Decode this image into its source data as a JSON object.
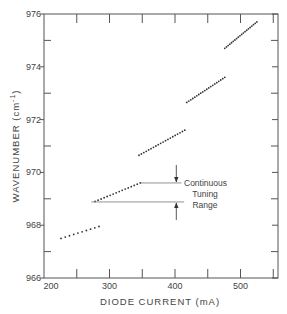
{
  "chart_data": {
    "type": "scatter",
    "title": "",
    "xlabel": "DIODE CURRENT (mA)",
    "ylabel": "WAVENUMBER (cm⁻¹)",
    "xlim": [
      200,
      560
    ],
    "ylim": [
      966,
      976
    ],
    "xticks_major": [
      200,
      300,
      400,
      500
    ],
    "xticks_minor": [
      250,
      350,
      450,
      550
    ],
    "yticks_major": [
      966,
      968,
      970,
      972,
      974,
      976
    ],
    "yticks_minor": [
      967,
      969,
      971,
      973,
      975
    ],
    "grid": false,
    "legend": null,
    "series": [
      {
        "name": "mode-1",
        "start": [
          226,
          967.5
        ],
        "end": [
          284,
          967.95
        ],
        "count": 10
      },
      {
        "name": "mode-2",
        "start": [
          278,
          968.9
        ],
        "end": [
          347,
          969.6
        ],
        "count": 16
      },
      {
        "name": "mode-3",
        "start": [
          345,
          970.65
        ],
        "end": [
          415,
          971.6
        ],
        "count": 20
      },
      {
        "name": "mode-4",
        "start": [
          418,
          972.65
        ],
        "end": [
          476,
          973.6
        ],
        "count": 20
      },
      {
        "name": "mode-5",
        "start": [
          476,
          974.7
        ],
        "end": [
          525,
          975.7
        ],
        "count": 20
      }
    ],
    "annotation": {
      "lines": [
        "Continuous",
        "Tuning",
        "Range"
      ],
      "upper_level": 969.6,
      "lower_level": 968.88,
      "upper_line_x": [
        348,
        410
      ],
      "lower_line_x": [
        272,
        414
      ],
      "arrow_x": 402
    }
  },
  "axis": {
    "x_title": "DIODE CURRENT (mA)",
    "y_title_main": "WAVENUMBER (cm",
    "y_title_sup": "-1",
    "y_title_close": ")"
  }
}
